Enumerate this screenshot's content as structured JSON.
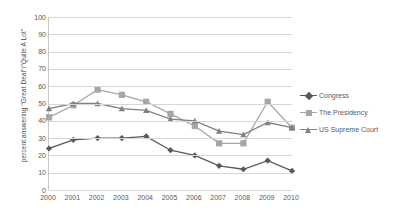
{
  "chart_data": {
    "type": "line",
    "title": "",
    "xlabel": "",
    "ylabel": "percent answering \"Great Deal\"/\"Quite A Lot\"",
    "categories": [
      "2000",
      "2001",
      "2002",
      "2003",
      "2004",
      "2005",
      "2006",
      "2007",
      "2008",
      "2009",
      "2010"
    ],
    "x": [
      2000,
      2001,
      2002,
      2003,
      2004,
      2005,
      2006,
      2007,
      2008,
      2009,
      2010
    ],
    "ylim": [
      0,
      100
    ],
    "yticks": [
      0,
      10,
      20,
      30,
      40,
      50,
      60,
      70,
      80,
      90,
      100
    ],
    "grid": true,
    "legend_position": "right",
    "series": [
      {
        "name": "Congress",
        "color": "#595959",
        "marker": "diamond",
        "values": [
          24,
          29,
          30,
          30,
          31,
          23,
          20,
          14,
          12,
          17,
          11
        ]
      },
      {
        "name": "The Presidency",
        "color": "#a6a6a6",
        "marker": "square",
        "values": [
          42,
          49,
          58,
          55,
          51,
          44,
          37,
          27,
          27,
          51,
          36
        ]
      },
      {
        "name": "US Supreme Court",
        "color": "#808080",
        "marker": "triangle",
        "values": [
          47,
          50,
          50,
          47,
          46,
          41,
          40,
          34,
          32,
          39,
          36
        ]
      }
    ]
  },
  "legend": {
    "entries": [
      {
        "label": "Congress"
      },
      {
        "label": "The Presidency"
      },
      {
        "label": "US Supreme Court"
      }
    ]
  }
}
